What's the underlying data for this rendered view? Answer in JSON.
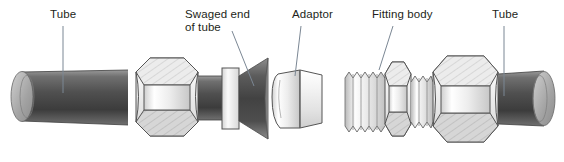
{
  "figure": {
    "background_color": "#ffffff",
    "width": 564,
    "height": 162,
    "label_color": "#231f20",
    "leader_color": "#6f7c8f",
    "outline_color": "#555555"
  },
  "labels": [
    {
      "id": "tube-left",
      "text": "Tube",
      "x": 50,
      "y": 10
    },
    {
      "id": "swaged-end",
      "text": "Swaged end",
      "x": 185,
      "y": 10
    },
    {
      "id": "swaged-end2",
      "text": "of tube",
      "x": 185,
      "y": 23
    },
    {
      "id": "adaptor",
      "text": "Adaptor",
      "x": 292,
      "y": 10
    },
    {
      "id": "fitting",
      "text": "Fitting body",
      "x": 372,
      "y": 10
    },
    {
      "id": "tube-right",
      "text": "Tube",
      "x": 492,
      "y": 10
    }
  ],
  "leaders": [
    {
      "id": "leader-tube-left",
      "x1": 63,
      "y1": 26,
      "x2": 63,
      "y2": 93
    },
    {
      "id": "leader-swaged",
      "x1": 232,
      "y1": 30,
      "x2": 253,
      "y2": 85
    },
    {
      "id": "leader-adaptor",
      "x1": 300,
      "y1": 26,
      "x2": 296,
      "y2": 75
    },
    {
      "id": "leader-fitting",
      "x1": 392,
      "y1": 26,
      "x2": 378,
      "y2": 72
    },
    {
      "id": "leader-tube-right",
      "x1": 504,
      "y1": 26,
      "x2": 504,
      "y2": 95
    }
  ],
  "parts": [
    {
      "id": "tube-left-body",
      "name": "tube-left-cylinder",
      "kind": "tube"
    },
    {
      "id": "tube-left-endcap",
      "name": "tube-left-end-ellipse",
      "kind": "ellipse"
    },
    {
      "id": "hex-nut-left",
      "name": "hex-nut-left",
      "kind": "hex-nut"
    },
    {
      "id": "collar-ring",
      "name": "collar-ring",
      "kind": "ring"
    },
    {
      "id": "swaged-cone",
      "name": "swaged-flare-cone",
      "kind": "cone"
    },
    {
      "id": "adaptor-body",
      "name": "adaptor",
      "kind": "adaptor"
    },
    {
      "id": "threaded-shank",
      "name": "threaded-shank",
      "kind": "thread",
      "thread_count": 5
    },
    {
      "id": "hex-small",
      "name": "hex-nut-small",
      "kind": "hex-nut"
    },
    {
      "id": "threaded-short",
      "name": "threaded-short-section",
      "kind": "thread",
      "thread_count": 3
    },
    {
      "id": "hex-nut-right",
      "name": "hex-nut-right",
      "kind": "hex-nut"
    },
    {
      "id": "tube-right-body",
      "name": "tube-right-cylinder",
      "kind": "tube"
    },
    {
      "id": "tube-right-endcap",
      "name": "tube-right-end-ellipse",
      "kind": "ellipse"
    }
  ],
  "colors": {
    "tube_dark": "#4a4a4a",
    "tube_mid": "#6e6e6e",
    "tube_light": "#a8a8a8",
    "metal_light": "#f2f2f2",
    "metal_mid": "#d9d9d9",
    "metal_shadow": "#b5b5b5",
    "hatch": "#c9c9c9",
    "outline": "#555555",
    "leader": "#7b8794"
  }
}
